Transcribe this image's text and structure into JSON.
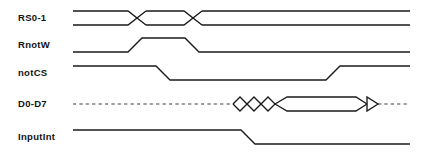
{
  "diagram": {
    "type": "digital-timing-diagram",
    "title": "",
    "width": 425,
    "height": 157,
    "background_color": "#ffffff",
    "line_color": "#1a1a1a",
    "time_axis": {
      "start_x": 73,
      "end_x": 410,
      "units": "arbitrary"
    },
    "signals": [
      {
        "name": "RS0-1",
        "label": "RS0-1",
        "kind": "bus",
        "row_index": 0,
        "y_high": 11,
        "y_low": 25,
        "label_y": 18,
        "transitions": [
          {
            "type": "crossover",
            "center_x": 137,
            "half_width": 9
          },
          {
            "type": "crossover",
            "center_x": 193,
            "half_width": 9
          }
        ],
        "segments": [
          {
            "from_x": 73,
            "to_x": 128,
            "state": "valid-A"
          },
          {
            "from_x": 146,
            "to_x": 184,
            "state": "valid-B"
          },
          {
            "from_x": 202,
            "to_x": 410,
            "state": "valid-C"
          }
        ]
      },
      {
        "name": "RnotW",
        "label": "RnotW",
        "kind": "logic",
        "row_index": 1,
        "y_high": 38,
        "y_low": 52,
        "label_y": 45,
        "initial_level": "low",
        "edges": [
          {
            "type": "rising",
            "start_x": 128,
            "end_x": 142
          },
          {
            "type": "falling",
            "start_x": 185,
            "end_x": 199
          }
        ],
        "segments": [
          {
            "from_x": 73,
            "to_x": 128,
            "level": "low"
          },
          {
            "from_x": 142,
            "to_x": 185,
            "level": "high"
          },
          {
            "from_x": 199,
            "to_x": 410,
            "level": "low"
          }
        ]
      },
      {
        "name": "notCS",
        "label": "notCS",
        "kind": "logic",
        "row_index": 2,
        "y_high": 66,
        "y_low": 80,
        "label_y": 73,
        "initial_level": "high",
        "edges": [
          {
            "type": "falling",
            "start_x": 156,
            "end_x": 170
          },
          {
            "type": "rising",
            "start_x": 326,
            "end_x": 340
          }
        ],
        "segments": [
          {
            "from_x": 73,
            "to_x": 156,
            "level": "high"
          },
          {
            "from_x": 170,
            "to_x": 326,
            "level": "low"
          },
          {
            "from_x": 340,
            "to_x": 410,
            "level": "high"
          }
        ]
      },
      {
        "name": "D0-D7",
        "label": "D0-D7",
        "kind": "bus",
        "row_index": 3,
        "y_high": 97,
        "y_low": 111,
        "y_mid": 104,
        "label_y": 104,
        "hi_z_style": "dashed",
        "segments": [
          {
            "from_x": 73,
            "to_x": 233,
            "state": "high-impedance"
          },
          {
            "from_x": 233,
            "to_x": 277,
            "state": "transient-diamonds"
          },
          {
            "from_x": 277,
            "to_x": 355,
            "state": "valid-data"
          },
          {
            "from_x": 380,
            "to_x": 410,
            "state": "high-impedance"
          }
        ],
        "diamonds": [
          {
            "center_x": 240,
            "half_width": 7
          },
          {
            "center_x": 254,
            "half_width": 7
          },
          {
            "center_x": 268,
            "half_width": 7
          },
          {
            "center_x": 367,
            "half_width": 11
          }
        ]
      },
      {
        "name": "InputInt",
        "label": "InputInt",
        "kind": "logic",
        "row_index": 4,
        "y_high": 130,
        "y_low": 144,
        "label_y": 137,
        "initial_level": "high",
        "edges": [
          {
            "type": "falling",
            "start_x": 241,
            "end_x": 255
          }
        ],
        "segments": [
          {
            "from_x": 73,
            "to_x": 241,
            "level": "high"
          },
          {
            "from_x": 255,
            "to_x": 410,
            "level": "low"
          }
        ]
      }
    ]
  }
}
